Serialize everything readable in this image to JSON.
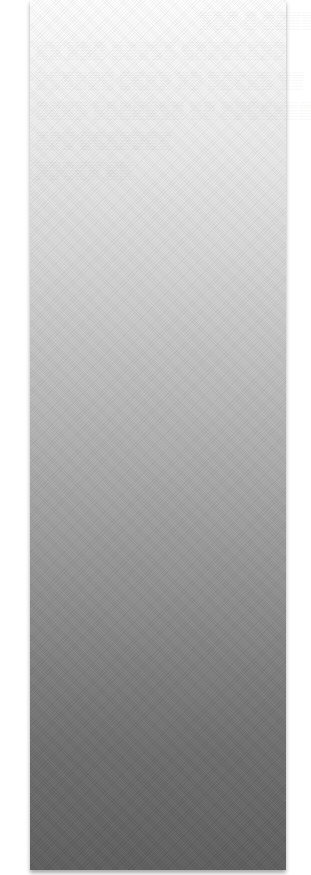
{
  "page": {
    "background": "#ffffff"
  },
  "panel": {
    "gradient_top": "#ffffff",
    "gradient_bottom": "#5d5d5d",
    "content": ""
  },
  "faded_text": {
    "legible": false,
    "lines": [
      "▒▒▒ ▒ ▒▒▒▒ ▒▒",
      "▒▒ ▒▒▒ ▒▒▒▒▒ ▒▒▒▒▒▒▒▒",
      "▒▒▒▒▒▒ ▒▒▒▒ ▒▒ ▒▒▒▒▒ ▒▒",
      "▒▒▒▒ ▒▒▒▒▒▒▒ ▒▒ ▒▒▒▒▒▒▒",
      "▒▒▒ ▒▒▒▒▒▒▒",
      "▒▒▒▒▒ ▒▒"
    ]
  }
}
